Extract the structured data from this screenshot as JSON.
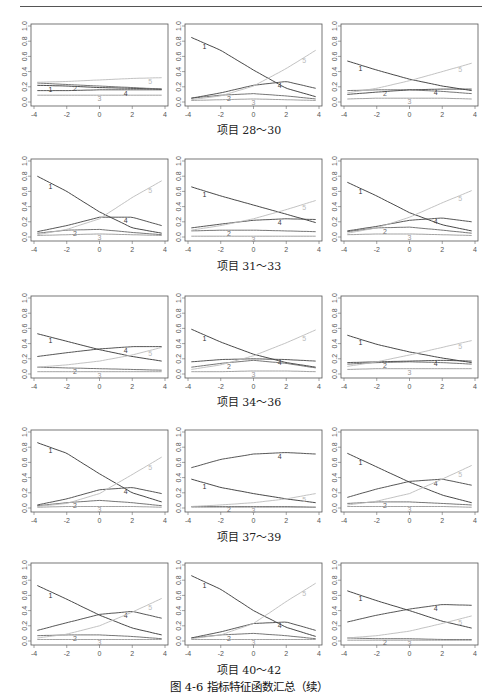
{
  "figure": {
    "caption": "图 4-6   指标特征函数汇总（续）",
    "row_captions": [
      "项目 28～30",
      "项目 31～33",
      "项目 34～36",
      "项目 37～39",
      "项目 40～42"
    ]
  },
  "chart_data": {
    "type": "line",
    "title": "指标特征函数汇总（续）",
    "xlabel": "",
    "ylabel": "",
    "xlim": [
      -4,
      4
    ],
    "ylim": [
      0,
      1
    ],
    "x_ticks": [
      -4,
      -2,
      0,
      2,
      4
    ],
    "y_ticks": [
      0.0,
      0.2,
      0.4,
      0.6,
      0.8,
      1.0
    ],
    "y_tick_labels": [
      "0.0",
      "0.2",
      "0.4",
      "0.6",
      "0.8",
      "1.0"
    ],
    "grid": false,
    "legend": "inline curve labels 1-5",
    "x": [
      -3.8,
      -2,
      0,
      2,
      3.8
    ],
    "series_colors": {
      "1": "#333333",
      "2": "#666666",
      "3": "#999999",
      "4": "#444444",
      "5": "#bbbbbb"
    },
    "panels": [
      {
        "item": 28,
        "series": [
          {
            "name": "1",
            "values": [
              0.22,
              0.21,
              0.19,
              0.18,
              0.17
            ]
          },
          {
            "name": "2",
            "values": [
              0.25,
              0.23,
              0.21,
              0.19,
              0.17
            ]
          },
          {
            "name": "3",
            "values": [
              0.09,
              0.09,
              0.09,
              0.09,
              0.09
            ]
          },
          {
            "name": "4",
            "values": [
              0.15,
              0.15,
              0.16,
              0.16,
              0.16
            ]
          },
          {
            "name": "5",
            "values": [
              0.26,
              0.27,
              0.29,
              0.31,
              0.32
            ]
          }
        ]
      },
      {
        "item": 29,
        "series": [
          {
            "name": "1",
            "values": [
              0.85,
              0.68,
              0.42,
              0.18,
              0.07
            ]
          },
          {
            "name": "2",
            "values": [
              0.05,
              0.09,
              0.11,
              0.08,
              0.04
            ]
          },
          {
            "name": "3",
            "values": [
              0.02,
              0.03,
              0.04,
              0.03,
              0.02
            ]
          },
          {
            "name": "4",
            "values": [
              0.05,
              0.12,
              0.22,
              0.27,
              0.18
            ]
          },
          {
            "name": "5",
            "values": [
              0.03,
              0.08,
              0.21,
              0.44,
              0.68
            ]
          }
        ]
      },
      {
        "item": 30,
        "series": [
          {
            "name": "1",
            "values": [
              0.54,
              0.42,
              0.3,
              0.21,
              0.15
            ]
          },
          {
            "name": "2",
            "values": [
              0.15,
              0.16,
              0.16,
              0.14,
              0.11
            ]
          },
          {
            "name": "3",
            "values": [
              0.04,
              0.05,
              0.05,
              0.05,
              0.04
            ]
          },
          {
            "name": "4",
            "values": [
              0.1,
              0.13,
              0.16,
              0.17,
              0.17
            ]
          },
          {
            "name": "5",
            "values": [
              0.12,
              0.18,
              0.28,
              0.4,
              0.51
            ]
          }
        ]
      },
      {
        "item": 31,
        "series": [
          {
            "name": "1",
            "values": [
              0.8,
              0.6,
              0.33,
              0.12,
              0.05
            ]
          },
          {
            "name": "2",
            "values": [
              0.05,
              0.09,
              0.1,
              0.06,
              0.03
            ]
          },
          {
            "name": "3",
            "values": [
              0.02,
              0.03,
              0.04,
              0.03,
              0.02
            ]
          },
          {
            "name": "4",
            "values": [
              0.07,
              0.15,
              0.26,
              0.26,
              0.15
            ]
          },
          {
            "name": "5",
            "values": [
              0.03,
              0.1,
              0.24,
              0.52,
              0.74
            ]
          }
        ]
      },
      {
        "item": 32,
        "series": [
          {
            "name": "1",
            "values": [
              0.66,
              0.54,
              0.42,
              0.3,
              0.19
            ]
          },
          {
            "name": "2",
            "values": [
              0.08,
              0.09,
              0.09,
              0.08,
              0.07
            ]
          },
          {
            "name": "3",
            "values": [
              0.01,
              0.01,
              0.01,
              0.01,
              0.01
            ]
          },
          {
            "name": "4",
            "values": [
              0.12,
              0.17,
              0.22,
              0.24,
              0.23
            ]
          },
          {
            "name": "5",
            "values": [
              0.09,
              0.15,
              0.24,
              0.36,
              0.48
            ]
          }
        ]
      },
      {
        "item": 33,
        "series": [
          {
            "name": "1",
            "values": [
              0.72,
              0.54,
              0.32,
              0.16,
              0.08
            ]
          },
          {
            "name": "2",
            "values": [
              0.07,
              0.12,
              0.13,
              0.09,
              0.05
            ]
          },
          {
            "name": "3",
            "values": [
              0.03,
              0.04,
              0.04,
              0.03,
              0.02
            ]
          },
          {
            "name": "4",
            "values": [
              0.08,
              0.14,
              0.22,
              0.25,
              0.2
            ]
          },
          {
            "name": "5",
            "values": [
              0.05,
              0.12,
              0.26,
              0.45,
              0.61
            ]
          }
        ]
      },
      {
        "item": 34,
        "series": [
          {
            "name": "1",
            "values": [
              0.53,
              0.43,
              0.32,
              0.23,
              0.17
            ]
          },
          {
            "name": "2",
            "values": [
              0.09,
              0.08,
              0.07,
              0.06,
              0.05
            ]
          },
          {
            "name": "3",
            "values": [
              0.03,
              0.03,
              0.03,
              0.03,
              0.03
            ]
          },
          {
            "name": "4",
            "values": [
              0.23,
              0.28,
              0.33,
              0.36,
              0.36
            ]
          },
          {
            "name": "5",
            "values": [
              0.09,
              0.12,
              0.17,
              0.25,
              0.35
            ]
          }
        ]
      },
      {
        "item": 35,
        "series": [
          {
            "name": "1",
            "values": [
              0.59,
              0.42,
              0.26,
              0.15,
              0.09
            ]
          },
          {
            "name": "2",
            "values": [
              0.09,
              0.14,
              0.18,
              0.14,
              0.08
            ]
          },
          {
            "name": "3",
            "values": [
              0.03,
              0.03,
              0.04,
              0.04,
              0.03
            ]
          },
          {
            "name": "4",
            "values": [
              0.16,
              0.19,
              0.2,
              0.19,
              0.17
            ]
          },
          {
            "name": "5",
            "values": [
              0.06,
              0.12,
              0.24,
              0.41,
              0.58
            ]
          }
        ]
      },
      {
        "item": 36,
        "series": [
          {
            "name": "1",
            "values": [
              0.51,
              0.39,
              0.29,
              0.21,
              0.15
            ]
          },
          {
            "name": "2",
            "values": [
              0.13,
              0.15,
              0.16,
              0.15,
              0.13
            ]
          },
          {
            "name": "3",
            "values": [
              0.06,
              0.07,
              0.07,
              0.07,
              0.07
            ]
          },
          {
            "name": "4",
            "values": [
              0.15,
              0.16,
              0.17,
              0.18,
              0.17
            ]
          },
          {
            "name": "5",
            "values": [
              0.1,
              0.16,
              0.25,
              0.35,
              0.44
            ]
          }
        ]
      },
      {
        "item": 37,
        "series": [
          {
            "name": "1",
            "values": [
              0.86,
              0.72,
              0.45,
              0.2,
              0.08
            ]
          },
          {
            "name": "2",
            "values": [
              0.03,
              0.07,
              0.1,
              0.07,
              0.03
            ]
          },
          {
            "name": "3",
            "values": [
              0.01,
              0.02,
              0.02,
              0.02,
              0.01
            ]
          },
          {
            "name": "4",
            "values": [
              0.04,
              0.12,
              0.24,
              0.27,
              0.19
            ]
          },
          {
            "name": "5",
            "values": [
              0.02,
              0.06,
              0.19,
              0.44,
              0.67
            ]
          }
        ]
      },
      {
        "item": 38,
        "series": [
          {
            "name": "1",
            "values": [
              0.38,
              0.27,
              0.19,
              0.12,
              0.07
            ]
          },
          {
            "name": "2",
            "values": [
              0.02,
              0.02,
              0.02,
              0.02,
              0.01
            ]
          },
          {
            "name": "3",
            "values": [
              0.01,
              0.01,
              0.01,
              0.01,
              0.01
            ]
          },
          {
            "name": "4",
            "values": [
              0.53,
              0.64,
              0.71,
              0.73,
              0.71
            ]
          },
          {
            "name": "5",
            "values": [
              0.02,
              0.04,
              0.07,
              0.12,
              0.19
            ]
          }
        ]
      },
      {
        "item": 39,
        "series": [
          {
            "name": "1",
            "values": [
              0.72,
              0.54,
              0.34,
              0.17,
              0.07
            ]
          },
          {
            "name": "2",
            "values": [
              0.06,
              0.08,
              0.08,
              0.06,
              0.04
            ]
          },
          {
            "name": "3",
            "values": [
              0.02,
              0.02,
              0.02,
              0.02,
              0.01
            ]
          },
          {
            "name": "4",
            "values": [
              0.14,
              0.25,
              0.35,
              0.38,
              0.3
            ]
          },
          {
            "name": "5",
            "values": [
              0.04,
              0.09,
              0.19,
              0.38,
              0.56
            ]
          }
        ]
      },
      {
        "item": 40,
        "series": [
          {
            "name": "1",
            "values": [
              0.73,
              0.55,
              0.34,
              0.17,
              0.08
            ]
          },
          {
            "name": "2",
            "values": [
              0.07,
              0.08,
              0.08,
              0.06,
              0.03
            ]
          },
          {
            "name": "3",
            "values": [
              0.02,
              0.02,
              0.02,
              0.02,
              0.02
            ]
          },
          {
            "name": "4",
            "values": [
              0.14,
              0.24,
              0.35,
              0.39,
              0.3
            ]
          },
          {
            "name": "5",
            "values": [
              0.04,
              0.09,
              0.2,
              0.38,
              0.56
            ]
          }
        ]
      },
      {
        "item": 41,
        "series": [
          {
            "name": "1",
            "values": [
              0.86,
              0.68,
              0.4,
              0.18,
              0.06
            ]
          },
          {
            "name": "2",
            "values": [
              0.04,
              0.08,
              0.1,
              0.07,
              0.03
            ]
          },
          {
            "name": "3",
            "values": [
              0.02,
              0.02,
              0.02,
              0.02,
              0.02
            ]
          },
          {
            "name": "4",
            "values": [
              0.04,
              0.12,
              0.23,
              0.25,
              0.14
            ]
          },
          {
            "name": "5",
            "values": [
              0.03,
              0.08,
              0.23,
              0.52,
              0.76
            ]
          }
        ]
      },
      {
        "item": 42,
        "series": [
          {
            "name": "1",
            "values": [
              0.66,
              0.53,
              0.4,
              0.26,
              0.17
            ]
          },
          {
            "name": "2",
            "values": [
              0.04,
              0.03,
              0.03,
              0.02,
              0.02
            ]
          },
          {
            "name": "3",
            "values": [
              0.01,
              0.01,
              0.01,
              0.01,
              0.01
            ]
          },
          {
            "name": "4",
            "values": [
              0.25,
              0.34,
              0.42,
              0.48,
              0.47
            ]
          },
          {
            "name": "5",
            "values": [
              0.04,
              0.07,
              0.13,
              0.23,
              0.33
            ]
          }
        ]
      }
    ]
  }
}
